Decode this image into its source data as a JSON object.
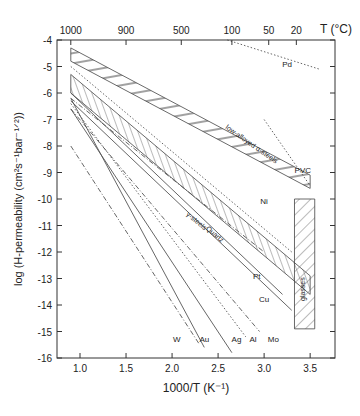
{
  "chart_data": {
    "type": "line",
    "provenance": {
      "text_labels": "read directly from image (axis ticks, titles, material labels)",
      "line_and_band_coordinates": "approximate — estimated from pixel positions via axis calibration (~92 px per 1000/T unit, ~26.5 px per log unit); no data labels present in source image. Expected error roughly ±0.2 in log-permeability and ±0.05 in 1000/T."
    },
    "title": "",
    "xlabel": "1000/T (K⁻¹)",
    "ylabel": "log (H-permeability (cm²s⁻¹bar⁻¹ᐟ²))",
    "xlim": [
      0.75,
      3.77
    ],
    "ylim": [
      -16,
      -4
    ],
    "x_ticks": [
      "1.0",
      "1.5",
      "2.0",
      "2.5",
      "3.0",
      "3.5"
    ],
    "y_ticks": [
      "-4",
      "-5",
      "-6",
      "-7",
      "-8",
      "-9",
      "-10",
      "-11",
      "-12",
      "-13",
      "-14",
      "-15",
      "-16"
    ],
    "top_axis": {
      "label": "T (°C)",
      "ticks": [
        "1000",
        "900",
        "500",
        "100",
        "50",
        "20"
      ],
      "tick_x": [
        0.9,
        1.5,
        2.1,
        2.65,
        3.05,
        3.35
      ]
    },
    "grid": false,
    "bands": [
      {
        "name": "low-alloyed α-steels",
        "hatch": "horizontal-diagonal",
        "poly": [
          [
            0.9,
            -4.3
          ],
          [
            3.5,
            -9.1
          ],
          [
            3.5,
            -9.6
          ],
          [
            0.9,
            -4.8
          ]
        ]
      },
      {
        "name": "γ-steels",
        "hatch": "vertical",
        "poly": [
          [
            0.9,
            -5.3
          ],
          [
            3.5,
            -12.9
          ],
          [
            3.5,
            -13.6
          ],
          [
            0.9,
            -6.0
          ]
        ]
      },
      {
        "name": "glasses",
        "hatch": "diagonal",
        "poly": [
          [
            3.33,
            -10.0
          ],
          [
            3.55,
            -10.0
          ],
          [
            3.55,
            -14.9
          ],
          [
            3.33,
            -14.9
          ]
        ]
      }
    ],
    "series": [
      {
        "name": "Pd",
        "style": "dotted",
        "x": [
          2.6,
          3.6
        ],
        "y": [
          -4.0,
          -5.1
        ]
      },
      {
        "name": "PVC",
        "style": "dotted",
        "x": [
          3.0,
          3.5
        ],
        "y": [
          -7.0,
          -9.5
        ]
      },
      {
        "name": "Ni",
        "style": "dotted",
        "x": [
          0.9,
          3.3
        ],
        "y": [
          -5.0,
          -12.0
        ]
      },
      {
        "name": "Quartz",
        "style": "dash-dot",
        "x": [
          0.9,
          3.0
        ],
        "y": [
          -6.2,
          -12.0
        ]
      },
      {
        "name": "Pt",
        "style": "solid",
        "x": [
          0.9,
          3.2
        ],
        "y": [
          -6.0,
          -13.6
        ]
      },
      {
        "name": "Cu",
        "style": "solid",
        "x": [
          0.9,
          3.3
        ],
        "y": [
          -6.3,
          -14.2
        ]
      },
      {
        "name": "Mo",
        "style": "dash-dot",
        "x": [
          0.9,
          2.95
        ],
        "y": [
          -6.6,
          -15.0
        ]
      },
      {
        "name": "Al",
        "style": "dotted",
        "x": [
          0.9,
          2.8
        ],
        "y": [
          -6.4,
          -15.2
        ]
      },
      {
        "name": "Ag",
        "style": "solid",
        "x": [
          0.9,
          2.65
        ],
        "y": [
          -6.6,
          -15.8
        ]
      },
      {
        "name": "Au",
        "style": "solid",
        "x": [
          0.9,
          2.35
        ],
        "y": [
          -6.2,
          -15.6
        ]
      },
      {
        "name": "W",
        "style": "dash-dot",
        "x": [
          0.9,
          2.3
        ],
        "y": [
          -8.0,
          -15.5
        ]
      }
    ],
    "labels": [
      {
        "text": "Pd",
        "x": 3.25,
        "y": -5.0
      },
      {
        "text": "PVC",
        "x": 3.42,
        "y": -9.0
      },
      {
        "text": "Ni",
        "x": 3.0,
        "y": -10.2
      },
      {
        "text": "Pt",
        "x": 2.92,
        "y": -13.0
      },
      {
        "text": "Cu",
        "x": 3.0,
        "y": -13.9
      },
      {
        "text": "W",
        "x": 2.05,
        "y": -15.4
      },
      {
        "text": "Au",
        "x": 2.35,
        "y": -15.4
      },
      {
        "text": "Ag",
        "x": 2.7,
        "y": -15.4
      },
      {
        "text": "Al",
        "x": 2.88,
        "y": -15.4
      },
      {
        "text": "Mo",
        "x": 3.1,
        "y": -15.4
      },
      {
        "text": "low-alloyed α-steels",
        "x": 2.85,
        "y": -8.0,
        "rotate": 35
      },
      {
        "text": "γ-steels",
        "x": 2.25,
        "y": -10.9,
        "rotate": 40
      },
      {
        "text": "Quartz",
        "x": 2.45,
        "y": -11.4,
        "rotate": 40
      },
      {
        "text": "glasses",
        "x": 3.44,
        "y": -13.4,
        "rotate": -90
      }
    ]
  }
}
